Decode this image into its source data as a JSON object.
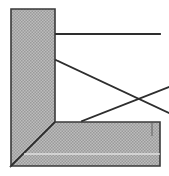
{
  "figure": {
    "canvas": {
      "width": 169,
      "height": 176,
      "background": "#ffffff"
    },
    "colors": {
      "background": "#ffffff",
      "hatch_fill": "#b3b3b3",
      "hatch_dot": "#8f8f8f",
      "outline": "#3a3a3a",
      "line": "#2e2e2e",
      "highlight": "#e8e8e8"
    },
    "stroke_widths": {
      "outline": 1.6,
      "construction_line": 1.8,
      "tick": 1.2
    },
    "shapes": [
      {
        "name": "vertical-band",
        "kind": "polygon",
        "description": "hatched vertical leg of the L-shaped frame",
        "points": "11,9 55,9 55,122 11,166"
      },
      {
        "name": "horizontal-band",
        "kind": "polygon",
        "description": "hatched horizontal leg of the L-shaped frame",
        "points": "11,166 55,122 160,122 160,166"
      },
      {
        "name": "mitre-joint-line",
        "kind": "line",
        "description": "45 degree mitre seam from inner corner to outer corner",
        "x1": 55,
        "y1": 122,
        "x2": 11,
        "y2": 166
      }
    ],
    "construction_lines": [
      {
        "name": "top-horizontal-line",
        "x1": 56,
        "y1": 34,
        "x2": 160,
        "y2": 34
      },
      {
        "name": "upper-descending-diagonal",
        "x1": 56,
        "y1": 60,
        "x2": 169,
        "y2": 113
      },
      {
        "name": "lower-ascending-diagonal",
        "x1": 82,
        "y1": 121,
        "x2": 169,
        "y2": 87
      }
    ],
    "marks": [
      {
        "name": "bottom-band-tick",
        "kind": "line",
        "x1": 152,
        "y1": 123,
        "x2": 152,
        "y2": 136
      },
      {
        "name": "bottom-band-highlight",
        "kind": "line",
        "x1": 24,
        "y1": 154,
        "x2": 160,
        "y2": 154
      }
    ],
    "labels": {
      "caption": "",
      "axis_x": "",
      "axis_y": ""
    }
  }
}
